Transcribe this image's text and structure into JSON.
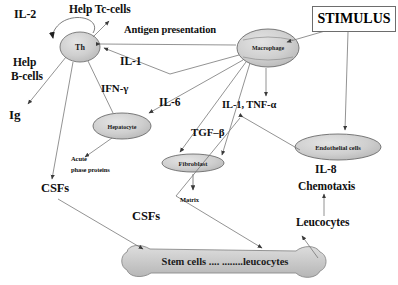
{
  "diagram": {
    "colors": {
      "cell_fill": "#c9c9c9",
      "cell_fill_light": "#d8d8d8",
      "stroke": "#5a5a5a",
      "text": "#101010",
      "background": "#ffffff"
    },
    "nodes": [
      {
        "id": "th",
        "label": "Th",
        "shape": "circle"
      },
      {
        "id": "macrophage",
        "label": "Macrophage",
        "shape": "ellipse"
      },
      {
        "id": "hepatocyte",
        "label": "Hepatocyte",
        "shape": "ellipse"
      },
      {
        "id": "fibroblast",
        "label": "Fibroblast",
        "shape": "ellipse"
      },
      {
        "id": "endothelial",
        "label": "Endothelial  cells",
        "shape": "ellipse"
      },
      {
        "id": "stemcells",
        "label": "Stem cells .... ........leucocytes",
        "shape": "bone"
      },
      {
        "id": "stimulus",
        "label": "STIMULUS",
        "shape": "box"
      }
    ],
    "labels": {
      "il2": "IL-2",
      "help_tc": "Help Tc-cells",
      "antigen_presentation": "Antigen presentation",
      "help_b1": "Help",
      "help_b2": "B-cells",
      "ig": "Ig",
      "il1": "IL-1",
      "ifn_gamma": "IFN-γ",
      "il6": "IL-6",
      "il1_tnf": "IL-1, TNF-α",
      "tgf_beta": "TGF–β",
      "acute1": "Acute",
      "acute2": "phase proteins",
      "matrix": "Matrix",
      "csfs_left": "CSFs",
      "csfs_center": "CSFs",
      "il8": "IL-8",
      "chemotaxis": "Chemotaxis",
      "leucocytes": "Leucocytes"
    }
  }
}
